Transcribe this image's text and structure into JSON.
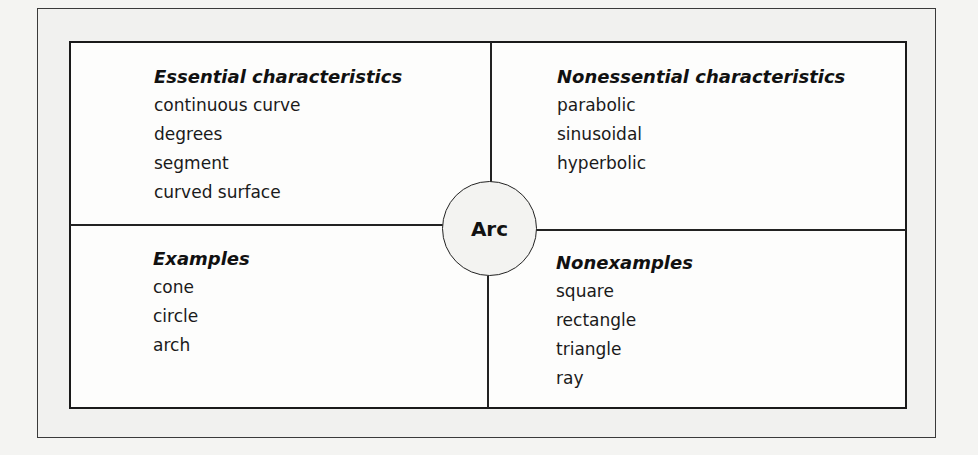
{
  "center": {
    "label": "Arc"
  },
  "quadrants": {
    "essential": {
      "heading": "Essential characteristics",
      "items": [
        "continuous curve",
        "degrees",
        "segment",
        "curved surface"
      ]
    },
    "nonessential": {
      "heading": "Nonessential characteristics",
      "items": [
        "parabolic",
        "sinusoidal",
        "hyperbolic"
      ]
    },
    "examples": {
      "heading": "Examples",
      "items": [
        "cone",
        "circle",
        "arch"
      ]
    },
    "nonexamples": {
      "heading": "Nonexamples",
      "items": [
        "square",
        "rectangle",
        "triangle",
        "ray"
      ]
    }
  }
}
